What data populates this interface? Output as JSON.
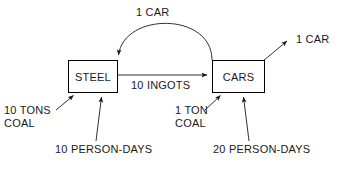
{
  "diagram": {
    "background_color": "#ffffff",
    "line_color": "#1a1a1a",
    "text_color": "#1a1a1a",
    "nodes": [
      {
        "id": "steel",
        "label": "STEEL"
      },
      {
        "id": "cars",
        "label": "CARS"
      }
    ],
    "labels": {
      "feedback_car": "1 CAR",
      "ingots": "10 INGOTS",
      "output_car": "1 CAR",
      "coal_steel": "10 TONS\nCOAL",
      "coal_cars": "1 TON\nCOAL",
      "person_days_steel": "10 PERSON-DAYS",
      "person_days_cars": "20 PERSON-DAYS"
    },
    "edges": [
      {
        "id": "feedback",
        "from": "cars",
        "to": "steel",
        "label": "1 CAR",
        "style": "arc"
      },
      {
        "id": "ingots",
        "from": "steel",
        "to": "cars",
        "label": "10 INGOTS",
        "style": "straight"
      },
      {
        "id": "output",
        "from": "cars",
        "to": "",
        "label": "1 CAR",
        "style": "straight"
      },
      {
        "id": "coal-in-steel",
        "from": "",
        "to": "steel",
        "label": "10 TONS COAL",
        "style": "straight"
      },
      {
        "id": "days-in-steel",
        "from": "",
        "to": "steel",
        "label": "10 PERSON-DAYS",
        "style": "straight"
      },
      {
        "id": "coal-in-cars",
        "from": "",
        "to": "cars",
        "label": "1 TON COAL",
        "style": "straight"
      },
      {
        "id": "days-in-cars",
        "from": "",
        "to": "cars",
        "label": "20 PERSON-DAYS",
        "style": "straight"
      }
    ]
  }
}
